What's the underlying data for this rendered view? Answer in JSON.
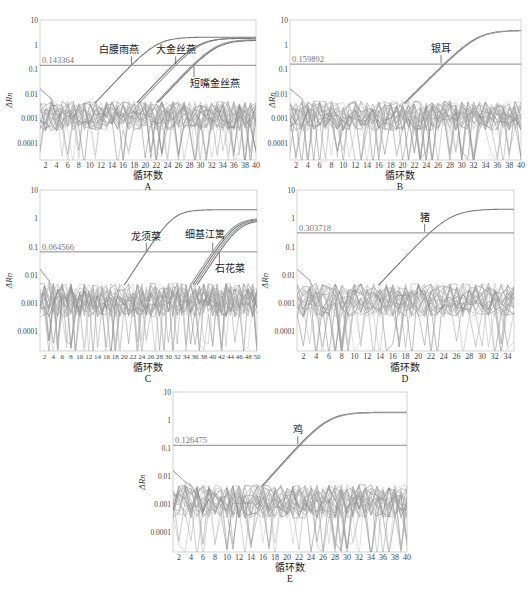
{
  "figure": {
    "panels_count": 5,
    "common_xlabel": "循环数",
    "common_ylabel": "ΔRn",
    "y_ticks": [
      "10",
      "1",
      "0.1",
      "0.01",
      "0.001",
      "0.0001"
    ],
    "colors": {
      "frame": "#c8c8c8",
      "axis_text": "#444444",
      "threshold": "#8a8a8a",
      "amp_curve": "#7a7a7a",
      "noise": [
        "#9a9a9a",
        "#b5b5b5",
        "#7d7d7d",
        "#c4c4c4",
        "#8c8c8c",
        "#a8a8a8"
      ]
    }
  },
  "chart_data": [
    {
      "panel": "A",
      "type": "line",
      "yscale": "log",
      "title": "",
      "xlabel": "循环数",
      "ylabel": "ΔRn",
      "ylim": [
        2e-05,
        10
      ],
      "xlim": [
        1,
        40
      ],
      "x_ticks": [
        2,
        4,
        6,
        8,
        10,
        12,
        14,
        16,
        18,
        20,
        22,
        24,
        26,
        28,
        30,
        32,
        34,
        36,
        38,
        40
      ],
      "threshold": 0.143364,
      "threshold_label": "0.143364",
      "series": [
        {
          "name": "白腰雨燕",
          "ct": 17.5,
          "plateau": 2.0
        },
        {
          "name": "大金丝燕",
          "ct": 25.5,
          "plateau": 1.9
        },
        {
          "name": "大金丝燕-2",
          "ct": 25.0,
          "plateau": 1.8
        },
        {
          "name": "短嘴金丝燕",
          "ct": 28.5,
          "plateau": 1.6
        },
        {
          "name": "短嘴金丝燕-2",
          "ct": 28.8,
          "plateau": 1.5
        }
      ],
      "annotations": [
        {
          "text": "白腰雨燕",
          "x": 17.5
        },
        {
          "text": "大金丝燕",
          "x": 25.5
        },
        {
          "text": "短嘴金丝燕",
          "x": 28.8
        }
      ]
    },
    {
      "panel": "B",
      "type": "line",
      "yscale": "log",
      "xlabel": "循环数",
      "ylabel": "ΔRn",
      "ylim": [
        2e-05,
        10
      ],
      "xlim": [
        1,
        40
      ],
      "x_ticks": [
        2,
        4,
        6,
        8,
        10,
        12,
        14,
        16,
        18,
        20,
        22,
        24,
        26,
        28,
        30,
        32,
        34,
        36,
        38,
        40
      ],
      "threshold": 0.159892,
      "threshold_label": "0.159892",
      "series": [
        {
          "name": "银耳",
          "ct": 27.0,
          "plateau": 3.8
        },
        {
          "name": "银耳-2",
          "ct": 27.2,
          "plateau": 3.7
        }
      ],
      "annotations": [
        {
          "text": "银耳",
          "x": 26.5
        }
      ]
    },
    {
      "panel": "C",
      "type": "line",
      "yscale": "log",
      "xlabel": "循环数",
      "ylabel": "ΔRn",
      "ylim": [
        2e-05,
        10
      ],
      "xlim": [
        1,
        50
      ],
      "x_ticks": [
        2,
        4,
        6,
        8,
        10,
        12,
        14,
        16,
        18,
        20,
        22,
        24,
        26,
        28,
        30,
        32,
        34,
        36,
        38,
        40,
        42,
        44,
        46,
        48,
        50
      ],
      "threshold": 0.064566,
      "threshold_label": "0.064566",
      "series": [
        {
          "name": "龙须菜",
          "ct": 25.0,
          "plateau": 2.0
        },
        {
          "name": "细基江篱",
          "ct": 40.0,
          "plateau": 1.0
        },
        {
          "name": "细基江篱-2",
          "ct": 40.5,
          "plateau": 0.95
        },
        {
          "name": "石花菜",
          "ct": 41.0,
          "plateau": 0.9
        },
        {
          "name": "石花菜-2",
          "ct": 41.5,
          "plateau": 0.85
        }
      ],
      "annotations": [
        {
          "text": "龙须菜",
          "x": 25.0
        },
        {
          "text": "细基江篱",
          "x": 40.0
        },
        {
          "text": "石花菜",
          "x": 41.5
        }
      ]
    },
    {
      "panel": "D",
      "type": "line",
      "yscale": "log",
      "xlabel": "循环数",
      "ylabel": "ΔRn",
      "ylim": [
        2e-05,
        10
      ],
      "xlim": [
        1,
        35
      ],
      "x_ticks": [
        2,
        4,
        6,
        8,
        10,
        12,
        14,
        16,
        18,
        20,
        22,
        24,
        26,
        28,
        30,
        32,
        34
      ],
      "threshold": 0.303718,
      "threshold_label": "0.303718",
      "series": [
        {
          "name": "猪",
          "ct": 21.8,
          "plateau": 2.1
        }
      ],
      "annotations": [
        {
          "text": "猪",
          "x": 21.0
        }
      ]
    },
    {
      "panel": "E",
      "type": "line",
      "yscale": "log",
      "xlabel": "循环数",
      "ylabel": "ΔRn",
      "ylim": [
        2e-05,
        10
      ],
      "xlim": [
        1,
        40
      ],
      "x_ticks": [
        2,
        4,
        6,
        8,
        10,
        12,
        14,
        16,
        18,
        20,
        22,
        24,
        26,
        28,
        30,
        32,
        34,
        36,
        38,
        40
      ],
      "threshold": 0.126475,
      "threshold_label": "0.126475",
      "series": [
        {
          "name": "鸡",
          "ct": 22.0,
          "plateau": 1.9
        },
        {
          "name": "鸡-2",
          "ct": 22.2,
          "plateau": 1.85
        }
      ],
      "annotations": [
        {
          "text": "鸡",
          "x": 21.8
        }
      ]
    }
  ]
}
